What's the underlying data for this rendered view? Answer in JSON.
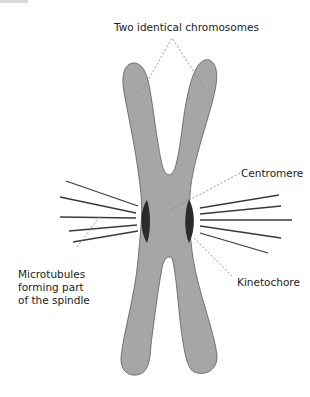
{
  "diagram": {
    "labels": {
      "chromosomes": "Two identical chromosomes",
      "centromere": "Centromere",
      "kinetochore": "Kinetochore",
      "microtubules": "Microtubules\nforming part\nof the spindle"
    },
    "colors": {
      "chromatid_fill": "#a6a6a6",
      "chromatid_stroke": "#5a5a5a",
      "kinetochore_fill": "#2b2b2b",
      "microtubule": "#3a3a3a",
      "leader_line": "#8a8a8a",
      "text": "#222222"
    }
  }
}
